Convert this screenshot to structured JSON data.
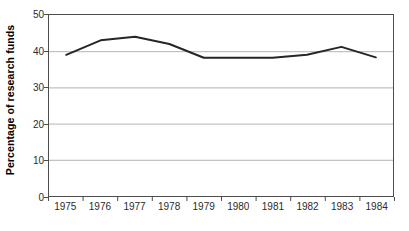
{
  "chart_data": {
    "type": "line",
    "title": "",
    "xlabel": "",
    "ylabel": "Percentage of research funds",
    "categories": [
      "1975",
      "1976",
      "1977",
      "1978",
      "1979",
      "1980",
      "1981",
      "1982",
      "1983",
      "1984"
    ],
    "values": [
      39,
      43,
      44,
      42,
      38.2,
      38.2,
      38.2,
      39,
      41.2,
      38.3
    ],
    "series": [
      {
        "name": "Percentage of research funds",
        "values": [
          39,
          43,
          44,
          42,
          38.2,
          38.2,
          38.2,
          39,
          41.2,
          38.3
        ]
      }
    ],
    "ylim": [
      0,
      50
    ],
    "yticks": [
      0,
      10,
      20,
      30,
      40,
      50
    ],
    "ytick_labels": [
      "0",
      "10",
      "20",
      "30",
      "40",
      "50"
    ],
    "grid": true,
    "grid_axis": "y",
    "legend": false,
    "legend_position": "none",
    "markers": false,
    "colors": {
      "line": "#262626",
      "grid": "#b3b3b3",
      "frame": "#4d4d4d",
      "background": "#ffffff",
      "text": "#1a1a1a"
    }
  }
}
